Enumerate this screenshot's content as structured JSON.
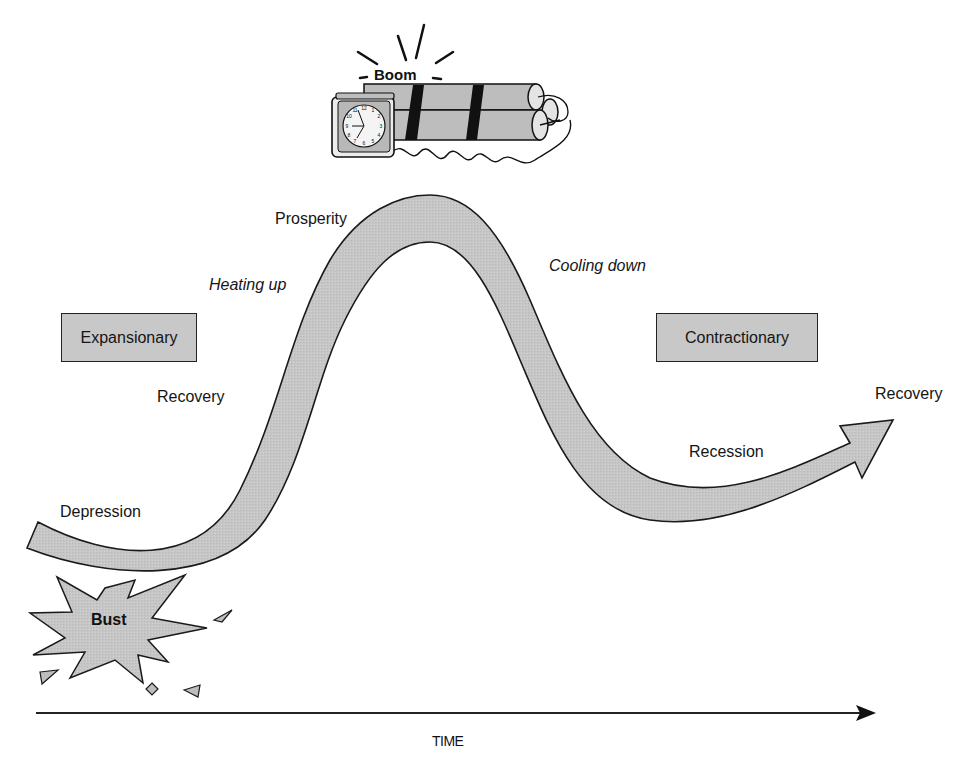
{
  "colors": {
    "fill": "#c8c8c8",
    "stroke": "#111111",
    "background": "#ffffff",
    "fuse_band": "#111111"
  },
  "icons": {
    "dynamite": "dynamite-bundle-with-clock-icon",
    "explosion": "starburst-explosion-icon"
  },
  "labels": {
    "boom": "Boom",
    "bust": "Bust",
    "prosperity": "Prosperity",
    "heating_up": "Heating up",
    "cooling_down": "Cooling down",
    "recovery_left": "Recovery",
    "depression": "Depression",
    "recession": "Recession",
    "recovery_right": "Recovery",
    "time_axis": "TIME"
  },
  "boxes": {
    "expansionary": "Expansionary",
    "contractionary": "Contractionary"
  },
  "phases": [
    {
      "name": "Depression",
      "position": "trough-left"
    },
    {
      "name": "Recovery",
      "position": "rising"
    },
    {
      "name": "Heating up",
      "position": "rising-late"
    },
    {
      "name": "Prosperity",
      "position": "peak"
    },
    {
      "name": "Cooling down",
      "position": "falling"
    },
    {
      "name": "Recession",
      "position": "trough-right"
    },
    {
      "name": "Recovery",
      "position": "arrow-head"
    }
  ]
}
